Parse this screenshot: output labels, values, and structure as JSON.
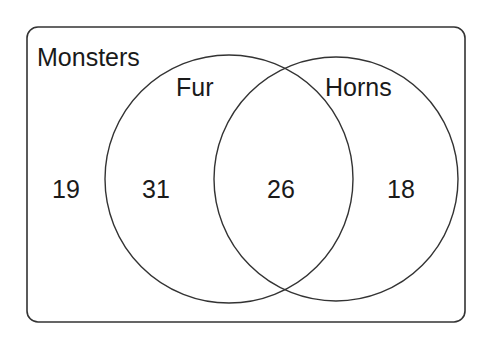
{
  "diagram": {
    "type": "venn",
    "universe": {
      "label": "Monsters",
      "outside_count": "19"
    },
    "sets": [
      {
        "label": "Fur",
        "only_count": "31"
      },
      {
        "label": "Horns",
        "only_count": "18"
      }
    ],
    "intersection_count": "26",
    "colors": {
      "stroke": "#333333",
      "text": "#1a1a1a",
      "background": "#ffffff"
    }
  }
}
